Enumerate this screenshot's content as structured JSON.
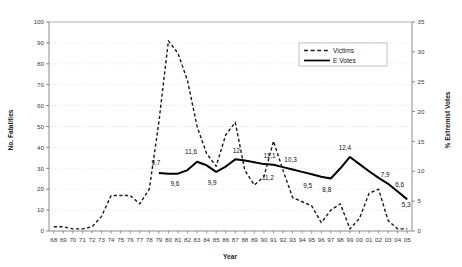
{
  "chart_data": {
    "type": "line",
    "title": "",
    "xlabel": "Year",
    "categories": [
      "68",
      "69",
      "70",
      "71",
      "72",
      "73",
      "74",
      "75",
      "76",
      "77",
      "78",
      "79",
      "80",
      "81",
      "82",
      "83",
      "84",
      "85",
      "86",
      "87",
      "88",
      "89",
      "90",
      "91",
      "92",
      "93",
      "94",
      "95",
      "96",
      "97",
      "98",
      "99",
      "00",
      "01",
      "02",
      "03",
      "04",
      "05"
    ],
    "axes": {
      "left": {
        "label": "No. Fatalities",
        "ticks": [
          0,
          10,
          20,
          30,
          40,
          50,
          60,
          70,
          80,
          90,
          100
        ],
        "lim": [
          0,
          100
        ]
      },
      "right": {
        "label": "% Extremist Votes",
        "ticks": [
          0,
          5,
          10,
          15,
          20,
          25,
          30,
          35
        ],
        "lim": [
          0,
          35
        ]
      }
    },
    "grid": "horizontal-dotted",
    "legend": {
      "position": "top-right",
      "entries": [
        {
          "name": "Victims",
          "style": "dashed",
          "color": "#1a1a1a"
        },
        {
          "name": "E Votes",
          "style": "solid",
          "color": "#000000"
        }
      ]
    },
    "series": [
      {
        "name": "Victims",
        "axis": "left",
        "style": "dashed",
        "color": "#1a1a1a",
        "values": [
          2,
          2,
          1,
          1,
          2,
          7,
          17,
          17,
          17,
          13,
          20,
          52,
          91,
          85,
          72,
          50,
          37,
          31,
          46,
          52,
          29,
          22,
          26,
          43,
          29,
          16,
          14,
          12,
          4,
          10,
          13,
          1,
          6,
          18,
          20,
          5,
          1,
          1
        ]
      },
      {
        "name": "E Votes",
        "axis": "right",
        "style": "solid",
        "color": "#000000",
        "values": [
          null,
          null,
          null,
          null,
          null,
          null,
          null,
          null,
          null,
          null,
          null,
          9.7,
          9.6,
          9.6,
          10.2,
          11.6,
          11.0,
          9.9,
          10.8,
          12.0,
          11.8,
          11.5,
          11.2,
          11.1,
          10.7,
          10.3,
          9.9,
          9.5,
          9.1,
          8.8,
          10.5,
          12.4,
          11.2,
          10.0,
          8.9,
          7.9,
          6.6,
          5.3
        ]
      }
    ],
    "annotations": [
      {
        "text": "9,7",
        "year": "79",
        "value": 9.7,
        "dx": -3,
        "dy": -8
      },
      {
        "text": "9,6",
        "year": "81",
        "value": 9.6,
        "dx": -3,
        "dy": 12
      },
      {
        "text": "11,6",
        "year": "83",
        "value": 11.6,
        "dx": -6,
        "dy": -8
      },
      {
        "text": "9,9",
        "year": "85",
        "value": 9.9,
        "dx": -4,
        "dy": 13
      },
      {
        "text": "12",
        "year": "87",
        "value": 12.0,
        "dx": 1,
        "dy": -6
      },
      {
        "text": "11,1",
        "year": "91",
        "value": 11.1,
        "dx": -4,
        "dy": -7
      },
      {
        "text": "11,2",
        "year": "90",
        "value": 11.2,
        "dx": 4,
        "dy": 16
      },
      {
        "text": "10,3",
        "year": "93",
        "value": 10.3,
        "dx": -2,
        "dy": -7
      },
      {
        "text": "9,5",
        "year": "95",
        "value": 9.5,
        "dx": -4,
        "dy": 14
      },
      {
        "text": "8,8",
        "year": "97",
        "value": 8.8,
        "dx": -4,
        "dy": 14
      },
      {
        "text": "12,4",
        "year": "99",
        "value": 12.4,
        "dx": -5,
        "dy": -7
      },
      {
        "text": "7,9",
        "year": "03",
        "value": 7.9,
        "dx": -3,
        "dy": -7
      },
      {
        "text": "6,6",
        "year": "04",
        "value": 6.6,
        "dx": 2,
        "dy": -5
      },
      {
        "text": "5,3",
        "year": "05",
        "value": 5.3,
        "dx": -1,
        "dy": 8
      }
    ]
  }
}
